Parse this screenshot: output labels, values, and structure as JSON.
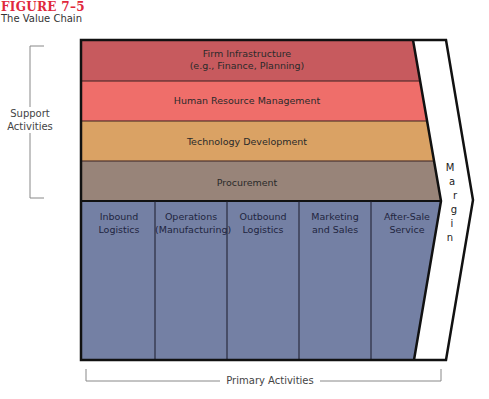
{
  "figure": {
    "label": "FIGURE 7–5",
    "title": "The Value Chain",
    "label_color": "#e0283c"
  },
  "support": {
    "group_label_line1": "Support",
    "group_label_line2": "Activities",
    "bands": [
      {
        "line1": "Firm Infrastructure",
        "line2": "(e.g., Finance, Planning)",
        "color": "#c75a5e"
      },
      {
        "line1": "Human Resource Management",
        "line2": "",
        "color": "#ef6e6a"
      },
      {
        "line1": "Technology Development",
        "line2": "",
        "color": "#daa264"
      },
      {
        "line1": "Procurement",
        "line2": "",
        "color": "#988479"
      }
    ]
  },
  "primary": {
    "group_label": "Primary Activities",
    "color": "#7480a4",
    "columns": [
      {
        "line1": "Inbound",
        "line2": "Logistics"
      },
      {
        "line1": "Operations",
        "line2": "(Manufacturing)"
      },
      {
        "line1": "Outbound",
        "line2": "Logistics"
      },
      {
        "line1": "Marketing",
        "line2": "and Sales"
      },
      {
        "line1": "After-Sale",
        "line2": "Service"
      }
    ]
  },
  "margin": {
    "label": "Margin",
    "letters": [
      "M",
      "a",
      "r",
      "g",
      "i",
      "n"
    ]
  }
}
